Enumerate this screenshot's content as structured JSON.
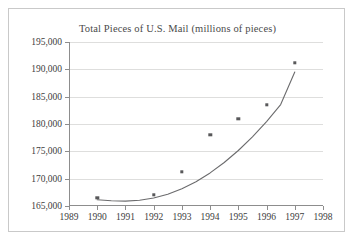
{
  "chart_data": {
    "type": "scatter",
    "title": "Total Pieces of U.S. Mail (millions of pieces)",
    "xlabel": "",
    "ylabel": "",
    "xlim": [
      1989,
      1998
    ],
    "ylim": [
      165000,
      195000
    ],
    "grid": true,
    "legend": null,
    "xticks": [
      "1989",
      "1990",
      "1991",
      "1992",
      "1993",
      "1994",
      "1995",
      "1996",
      "1997",
      "1998"
    ],
    "xtick_values": [
      1989,
      1990,
      1991,
      1992,
      1993,
      1994,
      1995,
      1996,
      1997,
      1998
    ],
    "yticks": [
      "165,000",
      "170,000",
      "175,000",
      "180,000",
      "185,000",
      "190,000",
      "195,000"
    ],
    "ytick_values": [
      165000,
      170000,
      175000,
      180000,
      185000,
      190000,
      195000
    ],
    "x": [
      1990,
      1992,
      1993,
      1994,
      1995,
      1996,
      1997
    ],
    "values": [
      166500,
      167000,
      171300,
      178000,
      180900,
      183500,
      191200
    ],
    "series": [
      {
        "name": "Total pieces of mail",
        "marker": "square",
        "color": "#58585a",
        "x": [
          1990,
          1992,
          1993,
          1994,
          1995,
          1996,
          1997
        ],
        "values": [
          166500,
          167000,
          171300,
          178000,
          180900,
          183500,
          191200
        ]
      },
      {
        "name": "Fitted quadratic trend",
        "type": "line",
        "color": "#6b6b6d",
        "x": [
          1990.0,
          1990.5,
          1991.0,
          1991.5,
          1992.0,
          1992.5,
          1993.0,
          1993.5,
          1994.0,
          1994.5,
          1995.0,
          1995.5,
          1996.0,
          1996.5,
          1997.0
        ],
        "values": [
          166150,
          165950,
          165900,
          166050,
          166450,
          167150,
          168150,
          169450,
          171050,
          172950,
          175150,
          177650,
          180450,
          183550,
          189500
        ]
      }
    ]
  },
  "colors": {
    "marker": "#58585a",
    "curve": "#6b6b6d",
    "grid": "#dededd",
    "axis": "#8d8d8d",
    "border": "#c9c9c9",
    "text": "#3d3d3d",
    "title_text": "#4a4a4a",
    "background": "#ffffff"
  }
}
